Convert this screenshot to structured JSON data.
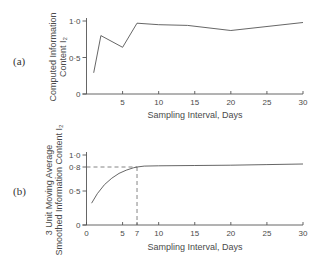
{
  "chart_data": [
    {
      "panel": "(a)",
      "type": "line",
      "title": "",
      "xlabel": "Sampling Interval, Days",
      "ylabel_lines": [
        "Computed Information",
        "Content I₂"
      ],
      "x_ticks": [
        5,
        10,
        15,
        20,
        25,
        30
      ],
      "x_tick_labels": [
        "5",
        "10",
        "15",
        "20",
        "25",
        "30"
      ],
      "y_ticks": [
        0,
        0.5,
        1.0
      ],
      "y_tick_labels": [
        "0",
        "0·5",
        "1·0"
      ],
      "xlim": [
        0,
        30
      ],
      "ylim": [
        0,
        1.0
      ],
      "grid": false,
      "legend": null,
      "x": [
        1,
        2,
        5,
        7,
        10,
        14,
        20,
        30
      ],
      "y": [
        0.29,
        0.8,
        0.64,
        0.97,
        0.95,
        0.94,
        0.87,
        0.98
      ]
    },
    {
      "panel": "(b)",
      "type": "line",
      "title": "",
      "xlabel": "Sampling Interval, Days",
      "ylabel_lines": [
        "3 Unit Moving Average",
        "Smoothed Information Content I₂"
      ],
      "x_ticks": [
        0,
        5,
        7,
        10,
        15,
        20,
        25,
        30
      ],
      "x_tick_labels": [
        "0",
        "5",
        "7",
        "10",
        "15",
        "20",
        "25",
        "30"
      ],
      "y_ticks": [
        0,
        0.5,
        0.8,
        1.0
      ],
      "y_tick_labels": [
        "0",
        "0·5",
        "0·8",
        "1·0"
      ],
      "xlim": [
        0,
        30
      ],
      "ylim": [
        0,
        1.0
      ],
      "grid": false,
      "legend": null,
      "x": [
        0.7,
        1.5,
        2.5,
        3.5,
        4.5,
        5.5,
        6.5,
        7,
        8,
        10,
        15,
        20,
        25,
        30
      ],
      "y": [
        0.32,
        0.46,
        0.58,
        0.66,
        0.72,
        0.76,
        0.79,
        0.8,
        0.815,
        0.82,
        0.825,
        0.83,
        0.84,
        0.85
      ],
      "annotations": [
        {
          "type": "dashed-guide",
          "x": 7,
          "y": 0.8,
          "label": "threshold 0.8 at 7 days"
        }
      ]
    }
  ]
}
